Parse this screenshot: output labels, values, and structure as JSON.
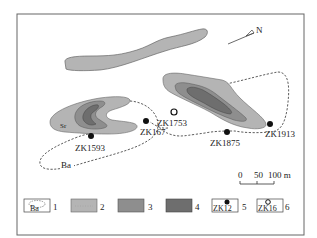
{
  "map": {
    "north_label": "N",
    "labels": {
      "sr": "Sr",
      "ba": "Ba"
    },
    "boreholes": [
      {
        "id": "ZK1593",
        "type": "filled"
      },
      {
        "id": "ZK167",
        "type": "filled"
      },
      {
        "id": "ZK1753",
        "type": "open"
      },
      {
        "id": "ZK1875",
        "type": "filled"
      },
      {
        "id": "ZK1913",
        "type": "filled"
      }
    ],
    "scale_bar": {
      "ticks": [
        "0",
        "50",
        "100 m"
      ]
    },
    "colors": {
      "zone2": "#b4b4b4",
      "zone3": "#8e8e8e",
      "zone4": "#6e6e6e",
      "outline": "#555555"
    }
  },
  "legend": {
    "items": [
      {
        "num": "1",
        "label": "Ba"
      },
      {
        "num": "2",
        "label": ""
      },
      {
        "num": "3",
        "label": ""
      },
      {
        "num": "4",
        "label": ""
      },
      {
        "num": "5",
        "label": "ZK12"
      },
      {
        "num": "6",
        "label": "ZK16"
      }
    ]
  }
}
